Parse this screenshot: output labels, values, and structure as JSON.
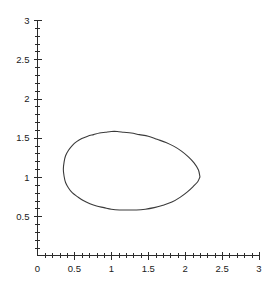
{
  "chart_data": {
    "type": "line",
    "title": "",
    "subtitle": "",
    "xlabel": "",
    "ylabel": "",
    "xlim": [
      0,
      3
    ],
    "ylim": [
      0,
      3
    ],
    "grid": false,
    "legend": false,
    "legend_position": "none",
    "curve_color": "#3a3a3a",
    "axis_color": "#2b2b2b",
    "background_color": "#ffffff",
    "x_ticks_major": [
      0,
      0.5,
      1,
      1.5,
      2,
      2.5,
      3
    ],
    "x_tick_labels": [
      "0",
      "0.5",
      "1",
      "1.5",
      "2",
      "2.5",
      "3"
    ],
    "y_ticks_major": [
      0,
      0.5,
      1,
      1.5,
      2,
      2.5,
      3
    ],
    "y_tick_labels": [
      "0",
      "0.5",
      "1",
      "1.5",
      "2",
      "2.5",
      "3"
    ],
    "minor_tick_step": 0.1,
    "series": [
      {
        "name": "closed-curve",
        "closed": true,
        "x": [
          2.2,
          2.18,
          2.12,
          2.04,
          1.95,
          1.85,
          1.74,
          1.62,
          1.5,
          1.38,
          1.27,
          1.17,
          1.08,
          1.0,
          0.92,
          0.84,
          0.76,
          0.68,
          0.6,
          0.53,
          0.47,
          0.42,
          0.38,
          0.36,
          0.35,
          0.36,
          0.38,
          0.42,
          0.47,
          0.54,
          0.62,
          0.71,
          0.8,
          0.9,
          1.0,
          1.11,
          1.22,
          1.34,
          1.46,
          1.58,
          1.7,
          1.82,
          1.93,
          2.03,
          2.11,
          2.17,
          2.2
        ],
        "y": [
          1.0,
          1.09,
          1.18,
          1.26,
          1.33,
          1.39,
          1.44,
          1.48,
          1.52,
          1.54,
          1.56,
          1.57,
          1.58,
          1.58,
          1.57,
          1.56,
          1.54,
          1.52,
          1.49,
          1.45,
          1.4,
          1.34,
          1.27,
          1.19,
          1.1,
          1.01,
          0.93,
          0.86,
          0.8,
          0.75,
          0.7,
          0.66,
          0.63,
          0.61,
          0.59,
          0.58,
          0.58,
          0.58,
          0.59,
          0.61,
          0.64,
          0.68,
          0.74,
          0.81,
          0.88,
          0.94,
          1.0
        ]
      }
    ],
    "annotations": [],
    "extremes": {
      "x_min": 0.35,
      "x_max": 2.2,
      "y_min": 0.58,
      "y_max": 1.58,
      "cusp_point": [
        2.2,
        1.0
      ]
    }
  }
}
